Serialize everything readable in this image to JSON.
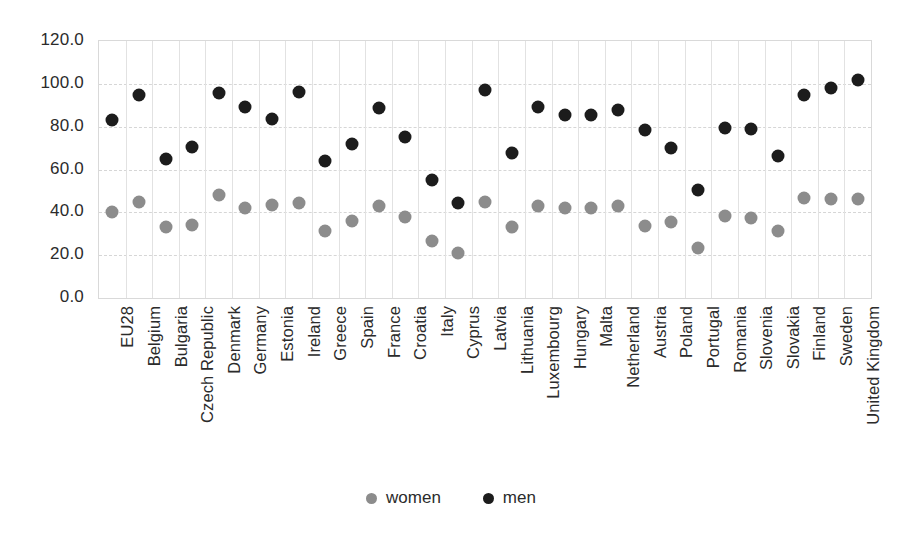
{
  "chart_data": {
    "type": "scatter",
    "title": "",
    "subtitle": "",
    "xlabel": "",
    "ylabel": "",
    "ylim": [
      0,
      120
    ],
    "ytick_labels": [
      "0.0",
      "20.0",
      "40.0",
      "60.0",
      "80.0",
      "100.0",
      "120.0"
    ],
    "ytick_values": [
      0,
      20,
      40,
      60,
      80,
      100,
      120
    ],
    "grid": true,
    "legend_position": "bottom",
    "categories": [
      "EU28",
      "Belgium",
      "Bulgaria",
      "Czech Republic",
      "Denmark",
      "Germany",
      "Estonia",
      "Ireland",
      "Greece",
      "Spain",
      "France",
      "Croatia",
      "Italy",
      "Cyprus",
      "Latvia",
      "Lithuania",
      "Luxembourg",
      "Hungary",
      "Malta",
      "Netherland",
      "Austria",
      "Poland",
      "Portugal",
      "Romania",
      "Slovenia",
      "Slovakia",
      "Finland",
      "Sweden",
      "United Kingdom"
    ],
    "series": [
      {
        "name": "women",
        "color": "#8c8c8c",
        "values": [
          40,
          45,
          33,
          34,
          48,
          42,
          43.5,
          44.5,
          31.5,
          36,
          43,
          38,
          26.5,
          21,
          45,
          33,
          43,
          42,
          42,
          43,
          33.5,
          35.5,
          23.5,
          38.5,
          37.5,
          31.5,
          46.5,
          46,
          46
        ]
      },
      {
        "name": "men",
        "color": "#1c1c1c",
        "values": [
          83,
          95,
          65,
          70.5,
          95.5,
          89,
          83.5,
          96,
          64,
          72,
          88.5,
          75,
          55,
          44.5,
          97,
          67.5,
          89,
          85.5,
          85.5,
          88,
          78.5,
          70,
          50.5,
          79.5,
          79,
          66.5,
          95,
          98,
          102
        ]
      }
    ]
  },
  "legend": {
    "entries": [
      {
        "label": "women",
        "color": "#8c8c8c"
      },
      {
        "label": "men",
        "color": "#1c1c1c"
      }
    ]
  }
}
